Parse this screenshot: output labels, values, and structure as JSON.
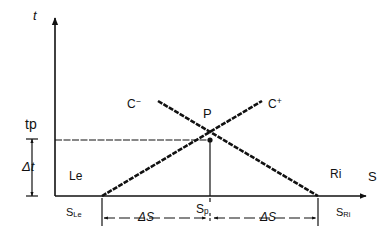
{
  "figure": {
    "type": "kinematic-characteristics-diagram",
    "ink_color": "#111111",
    "background_color": "#ffffff",
    "axes": {
      "vertical_label": "t",
      "horizontal_label": "S"
    },
    "labels": {
      "t_axis": "t",
      "s_axis": "S",
      "tp": "tp",
      "delta_t": "Δt",
      "le": "Le",
      "ri": "Ri",
      "c_minus": "C",
      "c_minus_sup": "−",
      "c_plus": "C",
      "c_plus_sup": "+",
      "point_p": "P",
      "s_le": "S",
      "s_le_sub": "Le",
      "s_p": "S",
      "s_p_sub": "p",
      "s_ri": "S",
      "s_ri_sub": "Ri",
      "delta_s_left": "ΔS",
      "delta_s_right": "ΔS"
    },
    "geometry": {
      "origin": {
        "x": 55,
        "y": 196
      },
      "point_p": {
        "x": 210,
        "y": 140
      },
      "c_plus_start": {
        "x": 102,
        "y": 196
      },
      "c_plus_end": {
        "x": 262,
        "y": 101
      },
      "c_minus_start": {
        "x": 158,
        "y": 101
      },
      "c_minus_end": {
        "x": 318,
        "y": 196
      },
      "tp_line_y": 140,
      "dimension_line_y": 218,
      "x_axis_end": {
        "x": 370,
        "y": 196
      },
      "y_axis_top": {
        "x": 55,
        "y": 14
      }
    }
  }
}
